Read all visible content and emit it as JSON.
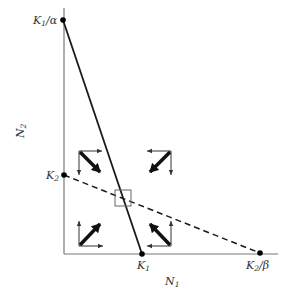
{
  "diagram": {
    "type": "phase-plane",
    "axes": {
      "x_label": "N",
      "x_label_sub": "1",
      "y_label": "N",
      "y_label_sub": "2",
      "color": "#777777"
    },
    "points": {
      "k1_over_alpha": {
        "main": "K",
        "sub": "1",
        "suffix": "/α"
      },
      "k2": {
        "main": "K",
        "sub": "2",
        "suffix": ""
      },
      "k1": {
        "main": "K",
        "sub": "1",
        "suffix": ""
      },
      "k2_over_beta": {
        "main": "K",
        "sub": "2",
        "suffix": "/β"
      }
    },
    "isoclines": [
      {
        "name": "species-1-isocline",
        "from": "K1/α",
        "to": "K1",
        "style": "solid"
      },
      {
        "name": "species-2-isocline",
        "from": "K2",
        "to": "K2/β",
        "style": "dashed"
      }
    ],
    "vector_groups": [
      {
        "region": "upper-left",
        "resultant": "down-right",
        "components": [
          "right",
          "down"
        ]
      },
      {
        "region": "upper-right",
        "resultant": "down-left",
        "components": [
          "left",
          "down"
        ]
      },
      {
        "region": "lower-left",
        "resultant": "up-right",
        "components": [
          "right",
          "up"
        ]
      },
      {
        "region": "lower-right",
        "resultant": "up-left",
        "components": [
          "left",
          "up"
        ]
      }
    ],
    "equilibrium_box": "intersection of isoclines",
    "colors": {
      "line": "#1a1a1a",
      "axis": "#777777",
      "box": "#666666"
    }
  }
}
